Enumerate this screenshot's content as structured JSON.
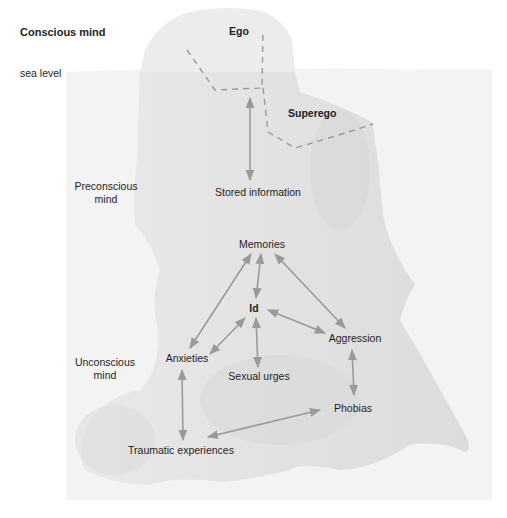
{
  "diagram": {
    "title": "Conscious mind",
    "sea_level_label": "sea level",
    "regions": {
      "ego": "Ego",
      "superego": "Superego",
      "preconscious": [
        "Preconscious",
        "mind"
      ],
      "unconscious": [
        "Unconscious",
        "mind"
      ]
    },
    "nodes": {
      "stored_information": "Stored information",
      "memories": "Memories",
      "id": "Id",
      "anxieties": "Anxieties",
      "aggression": "Aggression",
      "sexual_urges": "Sexual urges",
      "phobias": "Phobias",
      "traumatic_experiences": "Traumatic experiences"
    },
    "edges": [
      {
        "from": "ego",
        "to": "stored_information",
        "type": "bidirectional"
      },
      {
        "from": "memories",
        "to": "id",
        "type": "bidirectional"
      },
      {
        "from": "memories",
        "to": "anxieties",
        "type": "bidirectional"
      },
      {
        "from": "memories",
        "to": "aggression",
        "type": "bidirectional"
      },
      {
        "from": "id",
        "to": "anxieties",
        "type": "bidirectional"
      },
      {
        "from": "id",
        "to": "aggression",
        "type": "bidirectional"
      },
      {
        "from": "id",
        "to": "sexual_urges",
        "type": "bidirectional"
      },
      {
        "from": "aggression",
        "to": "phobias",
        "type": "bidirectional"
      },
      {
        "from": "anxieties",
        "to": "traumatic_experiences",
        "type": "bidirectional"
      },
      {
        "from": "phobias",
        "to": "traumatic_experiences",
        "type": "bidirectional"
      }
    ],
    "colors": {
      "water": "#f2f2f2",
      "iceberg": "#e6e6e6",
      "iceberg_shadow": "#d4d4d4",
      "arrow": "#9a9a9a",
      "dashed_boundary": "#9a9a9a",
      "text": "#1e1e1e"
    }
  }
}
